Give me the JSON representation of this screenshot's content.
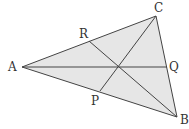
{
  "diagram": {
    "type": "triangle-medians",
    "fill_color": "#e6e6e6",
    "stroke_color": "#444444",
    "points": {
      "A": {
        "label": "A",
        "x": 22,
        "y": 67
      },
      "B": {
        "label": "B",
        "x": 177,
        "y": 117
      },
      "C": {
        "label": "C",
        "x": 156,
        "y": 16
      },
      "P": {
        "label": "P",
        "x": 100,
        "y": 91
      },
      "Q": {
        "label": "Q",
        "x": 167,
        "y": 67
      },
      "R": {
        "label": "R",
        "x": 89,
        "y": 41
      }
    },
    "segments": [
      "AB",
      "BC",
      "CA",
      "AQ",
      "BR",
      "CP"
    ]
  }
}
